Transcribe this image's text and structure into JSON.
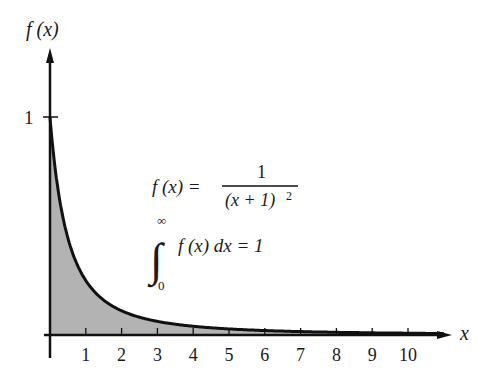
{
  "chart_data": {
    "type": "area",
    "title": "",
    "function": "f(x) = 1/(x+1)^2",
    "xlabel": "x",
    "ylabel": "f (x)",
    "xlim": [
      0,
      11
    ],
    "ylim": [
      0,
      1.2
    ],
    "x_ticks": [
      1,
      2,
      3,
      4,
      5,
      6,
      7,
      8,
      9,
      10
    ],
    "y_ticks": [
      1
    ],
    "x": [
      0,
      0.5,
      1,
      1.5,
      2,
      3,
      4,
      5,
      6,
      7,
      8,
      9,
      10,
      11
    ],
    "series": [
      {
        "name": "f(x)",
        "values": [
          1.0,
          0.444,
          0.25,
          0.16,
          0.111,
          0.0625,
          0.04,
          0.0278,
          0.0204,
          0.0156,
          0.0123,
          0.01,
          0.0083,
          0.0069
        ]
      }
    ],
    "shaded_region": "area under f(x) from 0 to infinity",
    "grid": false,
    "annotations": [
      {
        "text": "f (x) = 1 / (x + 1)^2"
      },
      {
        "text": "∫₀^∞ f (x) dx = 1"
      }
    ],
    "colors": {
      "curve": "#111111",
      "fill": "#b3b3b3",
      "axis": "#111111"
    }
  },
  "labels": {
    "y_axis": "f (x)",
    "x_axis": "x",
    "y_tick_1": "1",
    "formula_lhs": "f (x) =",
    "formula_num": "1",
    "formula_den": "(x + 1)",
    "formula_exp": "2",
    "integral_sign": "∫",
    "integral_upper": "∞",
    "integral_lower": "0",
    "integral_body": "f (x) dx = 1"
  }
}
